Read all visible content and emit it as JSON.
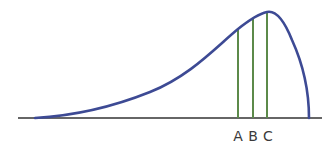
{
  "diagram": {
    "type": "left-skewed distribution curve",
    "colors": {
      "curve": "#3d4a94",
      "markers": "#5c8a4a",
      "axis": "#333333",
      "labels": "#3a3a3a"
    },
    "markers": [
      {
        "label": "A",
        "x": 238
      },
      {
        "label": "B",
        "x": 253
      },
      {
        "label": "C",
        "x": 267
      }
    ]
  }
}
